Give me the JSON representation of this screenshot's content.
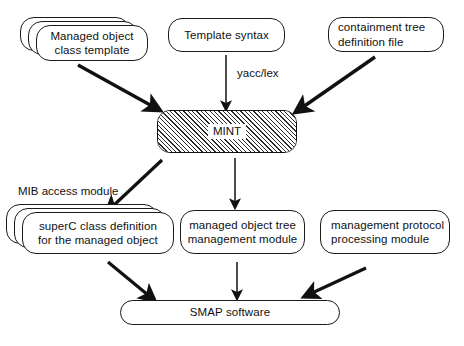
{
  "diagram": {
    "background_color": "#ffffff",
    "stroke_color": "#1a1a1a",
    "text_color": "#111111",
    "nodes": {
      "managed_object_class_template": {
        "lines": [
          "Managed object",
          "class template"
        ],
        "shape": "stacked-rounded-rectangle",
        "stack_count": 3
      },
      "template_syntax": {
        "lines": [
          "Template syntax"
        ],
        "shape": "rounded-rectangle"
      },
      "containment_tree_definition_file": {
        "lines": [
          "containment tree",
          "definition file"
        ],
        "shape": "rounded-rectangle"
      },
      "mint": {
        "lines": [
          "MINT"
        ],
        "shape": "hatched-rounded-rectangle",
        "fill": "diagonal-hatch"
      },
      "superc_class_definition": {
        "lines": [
          "superC class definition",
          "for the managed object"
        ],
        "shape": "stacked-rounded-rectangle",
        "stack_count": 3
      },
      "managed_object_tree_management_module": {
        "lines": [
          "managed object tree",
          "management module"
        ],
        "shape": "rounded-rectangle"
      },
      "management_protocol_processing_module": {
        "lines": [
          "management protocol",
          "processing module"
        ],
        "shape": "rounded-rectangle"
      },
      "smap_software": {
        "lines": [
          "SMAP software"
        ],
        "shape": "stadium"
      }
    },
    "edge_labels": {
      "yacc_lex": "yacc/lex",
      "mib_access_module": "MIB access module"
    },
    "edges": [
      {
        "from": "managed_object_class_template",
        "to": "mint",
        "style": "thick-arrow"
      },
      {
        "from": "template_syntax",
        "to": "mint",
        "style": "thin-arrow",
        "label": "yacc/lex"
      },
      {
        "from": "containment_tree_definition_file",
        "to": "mint",
        "style": "thick-arrow"
      },
      {
        "from": "mint",
        "to": "superc_class_definition",
        "style": "thick-arrow",
        "label": "MIB access module"
      },
      {
        "from": "mint",
        "to": "managed_object_tree_management_module",
        "style": "thin-arrow"
      },
      {
        "from": "superc_class_definition",
        "to": "smap_software",
        "style": "thick-arrow"
      },
      {
        "from": "managed_object_tree_management_module",
        "to": "smap_software",
        "style": "thin-arrow"
      },
      {
        "from": "management_protocol_processing_module",
        "to": "smap_software",
        "style": "thick-arrow"
      }
    ]
  }
}
